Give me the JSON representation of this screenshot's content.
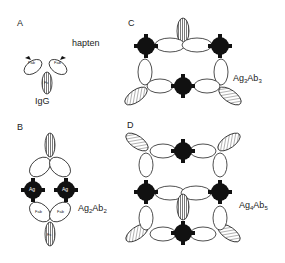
{
  "panels": [
    {
      "id": "A",
      "letter": "A",
      "label": "IgG",
      "annotation": "hapten",
      "parts": [
        "Fab",
        "Fab",
        "Fc"
      ]
    },
    {
      "id": "B",
      "letter": "B",
      "complex": {
        "ag": "Ag",
        "ag_n": "2",
        "ab": "Ab",
        "ab_n": "2"
      },
      "antigen_labels": [
        "Ag",
        "Ag"
      ],
      "parts": [
        "Fab",
        "Fab",
        "Fc"
      ]
    },
    {
      "id": "C",
      "letter": "C",
      "complex": {
        "ag": "Ag",
        "ag_n": "3",
        "ab": "Ab",
        "ab_n": "3"
      }
    },
    {
      "id": "D",
      "letter": "D",
      "complex": {
        "ag": "Ag",
        "ag_n": "4",
        "ab": "Ab",
        "ab_n": "5"
      }
    }
  ],
  "colors": {
    "ink": "#111111",
    "background": "#ffffff"
  }
}
